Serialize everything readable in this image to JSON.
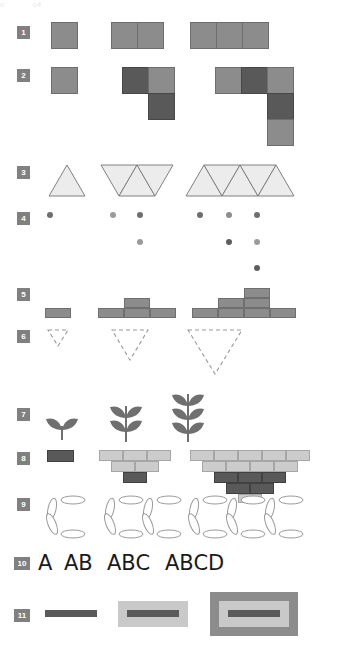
{
  "page": {
    "width": 342,
    "height": 660,
    "background": "#ffffff",
    "top_partial_text": [
      "o",
      "c4",
      "+"
    ]
  },
  "palette": {
    "badge_bg": "#808080",
    "badge_text": "#ffffff",
    "mid_gray": "#8c8c8c",
    "dark_gray": "#595959",
    "light_gray": "#cccccc",
    "outline": "#6e6e6e",
    "triangle_fill": "#ececec",
    "triangle_stroke": "#808080",
    "dashed_stroke": "#9a9a9a",
    "leaf_fill": "#6f6f6f",
    "ellipse_stroke": "#9a9a9a",
    "letter_color": "#1a1a1a"
  },
  "rows": [
    {
      "number": "1",
      "label": "squares-in-a-row",
      "type": "squares",
      "steps": [
        1,
        2,
        3
      ],
      "description": "row of identical mid-gray squares growing by one each step"
    },
    {
      "number": "2",
      "label": "l-shaped-square-cluster",
      "type": "squares-lshape",
      "steps": [
        1,
        3,
        5
      ],
      "description": "L shaped cluster of squares alternating mid and dark gray"
    },
    {
      "number": "3",
      "label": "triangle-strip",
      "type": "triangles",
      "steps": [
        1,
        3,
        5
      ],
      "description": "strip of alternating up and down pointing triangles"
    },
    {
      "number": "4",
      "label": "dot-staircase",
      "type": "dots",
      "steps": [
        1,
        3,
        6
      ],
      "description": "triangular staircase arrangement of small gray dots"
    },
    {
      "number": "5",
      "label": "stacked-bar-pyramid",
      "type": "bars",
      "steps": [
        1,
        3,
        6
      ],
      "description": "bar chart pyramid built from rectangular bars"
    },
    {
      "number": "6",
      "label": "dashed-down-triangle",
      "type": "dashed-triangles",
      "steps": [
        1,
        2,
        3
      ],
      "description": "dashed outline triangles pointing down, increasing in size"
    },
    {
      "number": "7",
      "label": "wheat-leaf-sprig",
      "type": "leaves",
      "steps": [
        1,
        2,
        3
      ],
      "description": "sprig with increasing number of leaf pairs"
    },
    {
      "number": "8",
      "label": "inverted-brick-pyramid",
      "type": "bricks",
      "steps": [
        1,
        6,
        15
      ],
      "description": "inverted pyramid made of light and dark bricks"
    },
    {
      "number": "9",
      "label": "ellipse-c-cluster",
      "type": "ellipses",
      "steps": [
        1,
        2,
        3
      ],
      "description": "clusters of four outlined ellipses forming a C"
    },
    {
      "number": "10",
      "label": "letter-sequence",
      "type": "text",
      "items": [
        "A",
        "AB",
        "ABC",
        "ABCD"
      ],
      "description": "growing alphabet strings"
    },
    {
      "number": "11",
      "label": "nested-rectangles",
      "type": "nested-rects",
      "steps": [
        1,
        2,
        3
      ],
      "description": "a dark bar progressively wrapped in nested rectangles"
    }
  ]
}
